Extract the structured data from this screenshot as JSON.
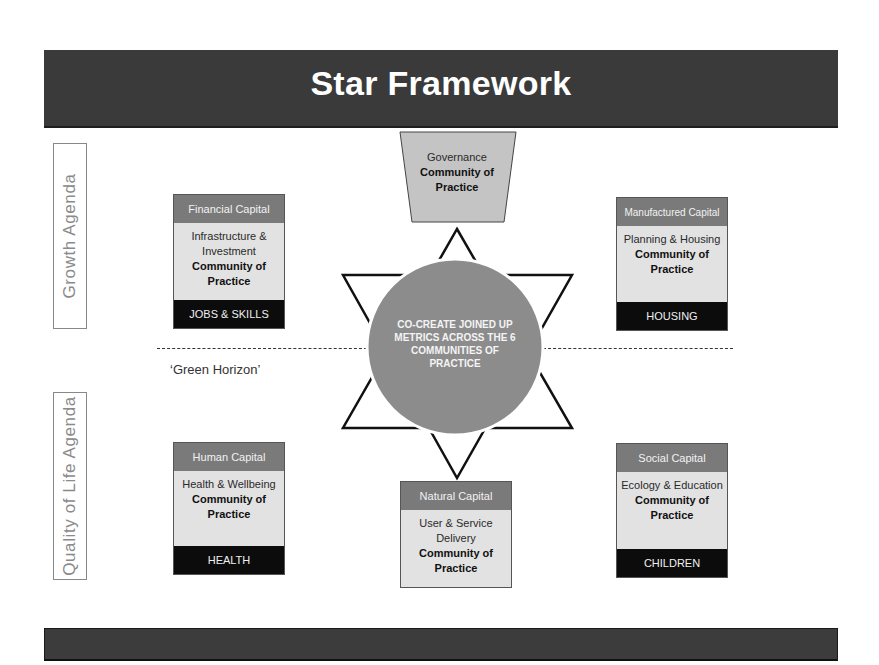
{
  "title": "Star Framework",
  "agendas": {
    "growth": "Growth Agenda",
    "quality_of_life": "Quality of Life Agenda"
  },
  "horizon_label": "‘Green Horizon’",
  "center": {
    "text": "CO-CREATE JOINED UP METRICS ACROSS THE 6 COMMUNITIES OF PRACTICE"
  },
  "governance": {
    "line1": "Governance",
    "line2": "Community of Practice"
  },
  "capitals": {
    "financial": {
      "header": "Financial Capital",
      "body": "Infrastructure & Investment",
      "bold": "Community of Practice",
      "footer": "JOBS & SKILLS"
    },
    "manufactured": {
      "header": "Manufactured Capital",
      "body": "Planning & Housing",
      "bold": "Community of Practice",
      "footer": "HOUSING"
    },
    "human": {
      "header": "Human Capital",
      "body": "Health & Wellbeing",
      "bold": "Community of Practice",
      "footer": "HEALTH"
    },
    "natural": {
      "header": "Natural Capital",
      "body": "User & Service Delivery",
      "bold": "Community of Practice"
    },
    "social": {
      "header": "Social Capital",
      "body": "Ecology & Education",
      "bold": "Community of Practice",
      "footer": "CHILDREN"
    }
  },
  "colors": {
    "banner": "#3a3a3a",
    "capital_header": "#7a7a7a",
    "capital_body": "#e2e2e2",
    "capital_footer": "#0c0c0c",
    "circle": "#8c8c8c",
    "governance_fill": "#c4c4c4"
  }
}
